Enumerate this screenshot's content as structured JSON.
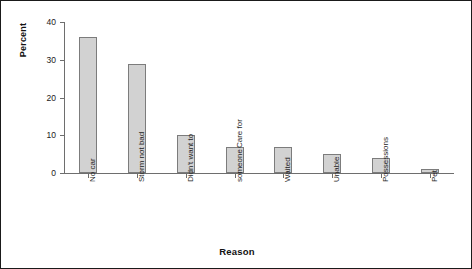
{
  "chart_data": {
    "type": "bar",
    "title": "",
    "xlabel": "Reason",
    "ylabel": "Percent",
    "categories": [
      "No car",
      "Storm not bad",
      "Didn't want to",
      "Care for someone",
      "Waited",
      "Unable",
      "Possessions",
      "Pet"
    ],
    "category_lines": [
      [
        "No car"
      ],
      [
        "Storm not bad"
      ],
      [
        "Didn't want to"
      ],
      [
        "Care for",
        "someone"
      ],
      [
        "Waited"
      ],
      [
        "Unable"
      ],
      [
        "Possessions"
      ],
      [
        "Pet"
      ]
    ],
    "values": [
      36,
      29,
      10,
      7,
      7,
      5,
      4,
      1
    ],
    "ylim": [
      0,
      40
    ],
    "yticks": [
      0,
      10,
      20,
      30,
      40
    ],
    "ytick_labels": [
      "0",
      "10",
      "20",
      "30",
      "40"
    ],
    "grid": false,
    "legend": false,
    "bar_fill_color": "#d2d2d2",
    "bar_edge_color": "#7c7c7c",
    "axis_color": "#6e6e6e",
    "frame_color": "#1a1a1a",
    "background_color": "#ffffff"
  }
}
